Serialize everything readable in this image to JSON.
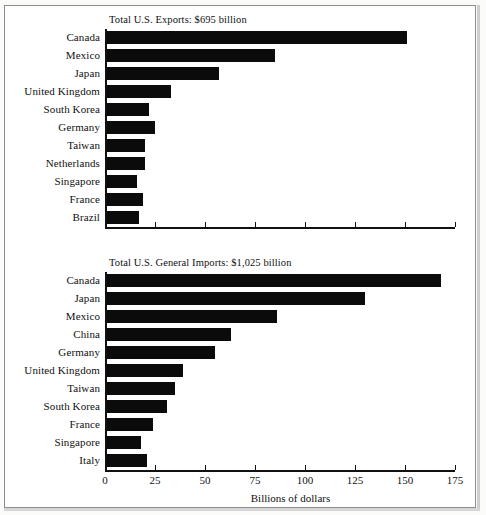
{
  "figure": {
    "background": "#ffffff",
    "bar_color": "#0b0b0b",
    "axis_color": "#111111",
    "axis_title": "Billions of dollars"
  },
  "chart_data": [
    {
      "type": "bar",
      "orientation": "horizontal",
      "title": "Total U.S. Exports: $695 billion",
      "xlabel": "",
      "ylabel": "",
      "xlim": [
        0,
        175
      ],
      "ticks": [
        0,
        25,
        50,
        75,
        100,
        125,
        150,
        175
      ],
      "tick_labels": [
        "",
        "",
        "",
        "",
        "",
        "",
        "",
        ""
      ],
      "grid": false,
      "legend": "none",
      "categories": [
        "Canada",
        "Mexico",
        "Japan",
        "United Kingdom",
        "South Korea",
        "Germany",
        "Taiwan",
        "Netherlands",
        "Singapore",
        "France",
        "Brazil"
      ],
      "values": [
        151,
        85,
        57,
        33,
        22,
        25,
        20,
        20,
        16,
        19,
        17
      ]
    },
    {
      "type": "bar",
      "orientation": "horizontal",
      "title": "Total U.S. General Imports: $1,025 billion",
      "xlabel": "Billions of dollars",
      "ylabel": "",
      "xlim": [
        0,
        175
      ],
      "ticks": [
        0,
        25,
        50,
        75,
        100,
        125,
        150,
        175
      ],
      "tick_labels": [
        "0",
        "25",
        "50",
        "75",
        "100",
        "125",
        "150",
        "175"
      ],
      "grid": false,
      "legend": "none",
      "categories": [
        "Canada",
        "Japan",
        "Mexico",
        "China",
        "Germany",
        "United Kingdom",
        "Taiwan",
        "South Korea",
        "France",
        "Singapore",
        "Italy"
      ],
      "values": [
        168,
        130,
        86,
        63,
        55,
        39,
        35,
        31,
        24,
        18,
        21
      ]
    }
  ]
}
